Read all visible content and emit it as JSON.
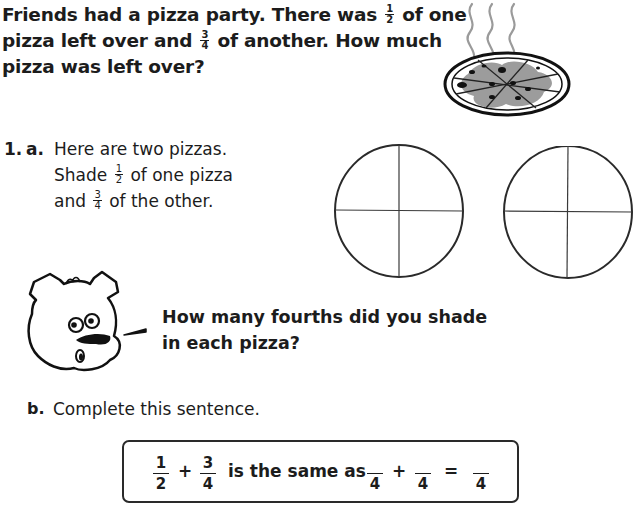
{
  "intro": {
    "line1_before": "Friends had a pizza party. There was ",
    "line1_frac": {
      "num": "1",
      "den": "2"
    },
    "line1_after": " of one",
    "line2_before": "pizza left over and ",
    "line2_frac": {
      "num": "3",
      "den": "4"
    },
    "line2_after": " of another. How much",
    "line3": "pizza was left over?"
  },
  "illustration": {
    "icon": "steaming-pizza-icon"
  },
  "question1": {
    "number": "1.",
    "part_a": {
      "letter": "a.",
      "line1": "Here are two pizzas.",
      "line2_before": "Shade ",
      "line2_frac": {
        "num": "1",
        "den": "2"
      },
      "line2_after": " of one pizza",
      "line3_before": "and ",
      "line3_frac": {
        "num": "3",
        "den": "4"
      },
      "line3_after": " of the other."
    },
    "pizzas": [
      {
        "name": "pizza-circle-1",
        "parts": 4,
        "shaded": 0
      },
      {
        "name": "pizza-circle-2",
        "parts": 4,
        "shaded": 0
      }
    ],
    "mascot": {
      "icon": "bear-mascot-icon",
      "speech_line1": "How many fourths did you shade",
      "speech_line2": "in each pizza?"
    },
    "part_b": {
      "letter": "b.",
      "instruction": "Complete this sentence.",
      "sentence": {
        "frac1": {
          "num": "1",
          "den": "2"
        },
        "plus1": "+",
        "frac2": {
          "num": "3",
          "den": "4"
        },
        "phrase": "is the same as",
        "blank1": {
          "num": "",
          "den": "4"
        },
        "plus2": "+",
        "blank2": {
          "num": "",
          "den": "4"
        },
        "equals": "=",
        "blank3": {
          "num": "",
          "den": "4"
        }
      }
    }
  }
}
